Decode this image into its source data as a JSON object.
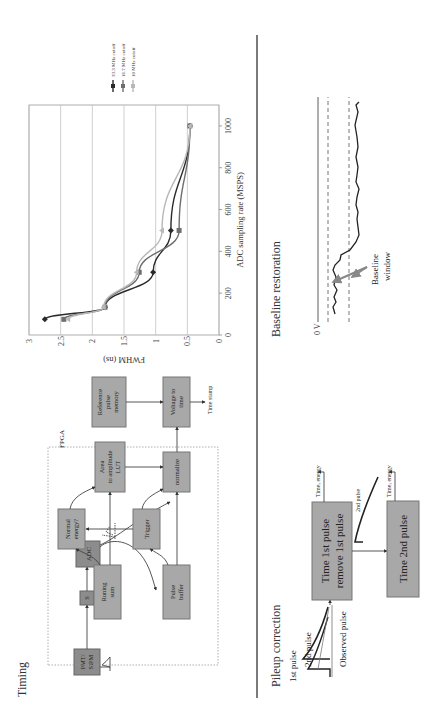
{
  "timing": {
    "title": "Timing",
    "fpga_label": "FPGA",
    "boxes": {
      "detector": [
        "PMT/",
        "SiPM"
      ],
      "filter": "S",
      "adc": "ADC",
      "running_sum": [
        "Runing",
        "sum"
      ],
      "pulse_buffer": [
        "Pulse",
        "buffer"
      ],
      "normal_energy": [
        "Normal",
        "energy?"
      ],
      "trigger": "Trigger",
      "area_lut": [
        "Area",
        "to amplitude",
        "LUT"
      ],
      "normalize": "normalize",
      "reference_memory": [
        "Reference",
        "pulse",
        "memory"
      ],
      "voltage_to_time": [
        "Voltage to",
        "time"
      ]
    },
    "output_label": "Time stamp"
  },
  "chart_data": {
    "type": "line",
    "title": "",
    "xlabel": "ADC sampling rate (MSPS)",
    "ylabel": "FWHM (ns)",
    "xlim": [
      0,
      1100
    ],
    "ylim": [
      0,
      3
    ],
    "xticks": [
      0,
      200,
      400,
      600,
      800,
      1000
    ],
    "yticks": [
      0,
      0.5,
      1,
      1.5,
      2,
      2.5,
      3
    ],
    "grid": "horizontal",
    "legend_position": "right",
    "series": [
      {
        "name": "33.3 MHz cutoff",
        "marker": "diamond",
        "color": "#2a2a2a",
        "x": [
          75,
          133,
          300,
          500,
          1000
        ],
        "y": [
          2.75,
          1.8,
          1.04,
          0.76,
          0.46
        ]
      },
      {
        "name": "16.7 MHz cutoff",
        "marker": "square",
        "color": "#6e6e6e",
        "x": [
          75,
          133,
          300,
          500,
          1000
        ],
        "y": [
          2.45,
          1.8,
          1.26,
          0.63,
          0.46
        ]
      },
      {
        "name": "10 MHz cutoff",
        "marker": "triangle",
        "color": "#b8b8b8",
        "x": [
          75,
          133,
          300,
          500,
          1000
        ],
        "y": [
          2.38,
          1.82,
          1.3,
          0.9,
          0.46
        ]
      }
    ]
  },
  "pileup": {
    "title": "Pileup correction",
    "first_pulse": "1st pulse",
    "second_pulse": "2nd pulse",
    "observed_pulse": "Observed pulse",
    "box1": [
      "Time 1st pulse",
      "remove 1st pulse"
    ],
    "box2": "Time 2nd pulse",
    "second_pulse_small": "2nd pulse",
    "output1": "Time, energy",
    "output2": "Time, energy"
  },
  "baseline": {
    "title": "Baseline restoration",
    "zero_label": "0 V",
    "window_label": [
      "Baseline",
      "window"
    ]
  }
}
